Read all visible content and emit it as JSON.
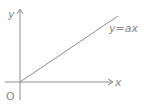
{
  "diagram": {
    "title": "",
    "axes": {
      "x_label": "x",
      "y_label": "y",
      "origin_label": "O"
    },
    "line": {
      "equation_label": "y=ax",
      "passes_through_origin": true
    },
    "colors": {
      "stroke": "#8c8c8c",
      "text": "#8a8a8a",
      "background": "#ffffff"
    }
  }
}
